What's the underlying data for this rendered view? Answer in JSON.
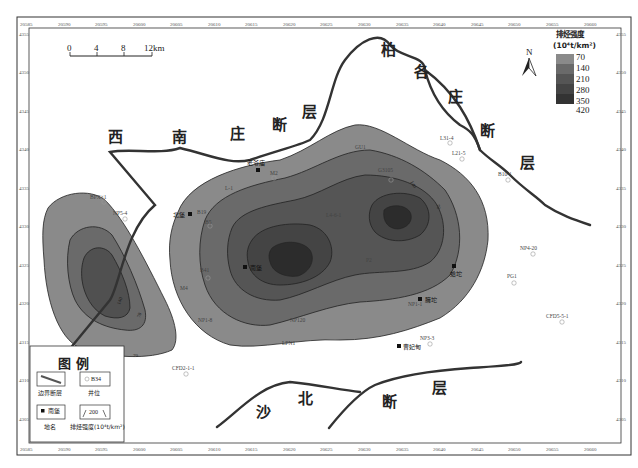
{
  "map": {
    "title_legend": "排烃强度",
    "unit": "(10⁴t/km²)",
    "colors": {
      "c70": "#8a8a8a",
      "c140": "#6a6a6a",
      "c210": "#555555",
      "c280": "#444444",
      "c350": "#333333",
      "c420": "#222222",
      "fault": "#333333",
      "frame": "#333333"
    },
    "intensity_legend": [
      "70",
      "140",
      "210",
      "280",
      "350",
      "420"
    ],
    "north_label": "N",
    "scale_bar": {
      "ticks": [
        "0",
        "4",
        "8",
        "12km"
      ]
    },
    "top_ticks": [
      "20585",
      "20590",
      "20595",
      "20600",
      "20605",
      "20610",
      "20615",
      "20620",
      "20625",
      "20630",
      "20635",
      "20640",
      "20645",
      "20650",
      "20655",
      "20660"
    ],
    "bottom_ticks": [
      "20585",
      "20590",
      "20595",
      "20600",
      "20605",
      "20610",
      "20615",
      "20620",
      "20625",
      "20630",
      "20635",
      "20640",
      "20645",
      "20650",
      "20655",
      "20660"
    ],
    "left_ticks": [
      "4355",
      "4350",
      "4345",
      "4340",
      "4335",
      "4330",
      "4325",
      "4320",
      "4315",
      "4310",
      "4305"
    ],
    "right_ticks": [
      "4355",
      "4350",
      "4345",
      "4340",
      "4335",
      "4330",
      "4325",
      "4320",
      "4315",
      "4310",
      "4305"
    ],
    "faults": {
      "xinanzhuang": [
        "西",
        "南",
        "庄",
        "断",
        "层"
      ],
      "baigezhuang": [
        "柏",
        "各",
        "庄",
        "断",
        "层"
      ],
      "shabei": [
        "沙",
        "北",
        "断",
        "层"
      ]
    },
    "places": [
      {
        "name": "老爷庙"
      },
      {
        "name": "北堡"
      },
      {
        "name": "南堡"
      },
      {
        "name": "蛤坨"
      },
      {
        "name": "臃坨"
      },
      {
        "name": "曹妃甸"
      }
    ],
    "wells": [
      "BPX×1",
      "NP5-4",
      "M2",
      "G3105",
      "GU1",
      "L31-4",
      "L21-5",
      "B10-1",
      "NP4-20",
      "PG1",
      "CFD5-5-1",
      "NP1-1",
      "NP3-3",
      "CFD2-1-1",
      "LPN1",
      "NP1-8",
      "NP120",
      "M4",
      "B5",
      "B19",
      "B41",
      "L-1",
      "L4-6-1",
      "P2",
      "B15",
      "T-1"
    ],
    "contour_labels": [
      "70",
      "140",
      "210",
      "280",
      "350"
    ],
    "legend_box": {
      "title": "图  例",
      "items": [
        {
          "caption": "边界断层",
          "inner": ""
        },
        {
          "caption": "井位",
          "inner": "B34"
        },
        {
          "caption": "地名",
          "inner": "南堡"
        },
        {
          "caption": "排烃强度(10⁴t/km²)",
          "inner": "200"
        }
      ]
    }
  }
}
